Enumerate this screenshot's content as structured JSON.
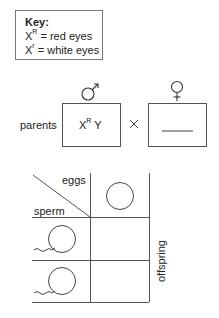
{
  "key": {
    "title": "Key:",
    "items": [
      {
        "symbol": "X",
        "sup": "R",
        "meaning": "= red eyes"
      },
      {
        "symbol": "X",
        "sup": "r",
        "meaning": "= white eyes"
      }
    ]
  },
  "parents": {
    "label": "parents",
    "male_symbol": "♂",
    "female_symbol": "♀",
    "male_genotype": {
      "base": "X",
      "sup": "R",
      "rest": "Y"
    },
    "cross_symbol": "×",
    "female_genotype": "blank"
  },
  "punnett": {
    "column_header": "eggs",
    "row_header": "sperm",
    "side_label": "offspring"
  }
}
